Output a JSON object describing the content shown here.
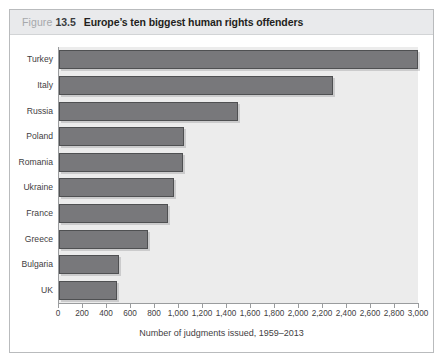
{
  "figure": {
    "label_word": "Figure",
    "number": "13.5",
    "title": "Europe’s ten biggest human rights offenders"
  },
  "chart_data": {
    "type": "bar",
    "orientation": "horizontal",
    "title": "Europe’s ten biggest human rights offenders",
    "categories": [
      "Turkey",
      "Italy",
      "Russia",
      "Poland",
      "Romania",
      "Ukraine",
      "France",
      "Greece",
      "Bulgaria",
      "UK"
    ],
    "values": [
      2990,
      2280,
      1490,
      1040,
      1035,
      960,
      910,
      740,
      500,
      480
    ],
    "xlabel": "Number of judgments issued, 1959–2013",
    "ylabel": "",
    "xlim": [
      0,
      3000
    ],
    "xticks": [
      0,
      200,
      400,
      600,
      800,
      1000,
      1200,
      1400,
      1600,
      1800,
      2000,
      2200,
      2400,
      2600,
      2800,
      3000
    ],
    "xtick_labels": [
      "0",
      "200",
      "400",
      "600",
      "800",
      "1,000",
      "1,200",
      "1,400",
      "1,600",
      "1,800",
      "2,000",
      "2,200",
      "2,400",
      "2,600",
      "2,800",
      "3,000"
    ],
    "grid": false,
    "legend": null,
    "bar_color": "#78787b",
    "bar_border_color": "#4f5052",
    "plot_background": "#ececec"
  }
}
